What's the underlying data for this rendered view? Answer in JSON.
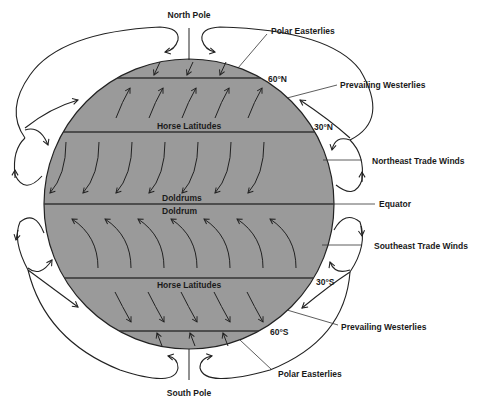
{
  "diagram": {
    "colors": {
      "earth": "#9a9a9a",
      "line": "#222222",
      "background": "#ffffff"
    },
    "poles": {
      "north": "North Pole",
      "south": "South Pole"
    },
    "latitudes": {
      "n60": "60°N",
      "n30": "30°N",
      "s30": "30°S",
      "s60": "60°S"
    },
    "inner_labels": {
      "horse_latitudes_north": "Horse Latitudes",
      "doldrums": "Doldrums",
      "doldrum": "Doldrum",
      "horse_latitudes_south": "Horse Latitudes"
    },
    "callouts": {
      "polar_easterlies_north": "Polar Easterlies",
      "prevailing_westerlies_north": "Prevailing Westerlies",
      "northeast_trade_winds": "Northeast Trade Winds",
      "equator": "Equator",
      "southeast_trade_winds": "Southeast Trade Winds",
      "prevailing_westerlies_south": "Prevailing Westerlies",
      "polar_easterlies_south": "Polar Easterlies"
    }
  }
}
